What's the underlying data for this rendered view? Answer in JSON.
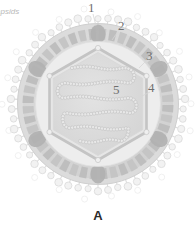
{
  "figure": {
    "panel_letter": "A",
    "side_caption": "apsids",
    "labels": [
      {
        "id": "1",
        "text": "1",
        "x": 88,
        "y": 2,
        "target": "glycoprotein-spikes"
      },
      {
        "id": "2",
        "text": "2",
        "x": 118,
        "y": 21,
        "target": "lipid-envelope"
      },
      {
        "id": "3",
        "text": "3",
        "x": 146,
        "y": 50,
        "target": "tegument-matrix"
      },
      {
        "id": "4",
        "text": "4",
        "x": 148,
        "y": 82,
        "target": "capsid-shell"
      },
      {
        "id": "5",
        "text": "5",
        "x": 113,
        "y": 84,
        "target": "nucleic-acid-genome"
      }
    ],
    "colors": {
      "background": "#ffffff",
      "spike_stroke": "#dcdcdc",
      "spike_fill": "#f2f2f2",
      "envelope_outer": "#dadada",
      "envelope_band": "#c9c9c9",
      "envelope_segment": "#bdbdbd",
      "vertex_cap": "#b0b0b0",
      "gap_light": "#eeeeee",
      "capsid_stroke": "#c6c6c6",
      "capsid_fill": "#e4e4e4",
      "core_fill": "#dcdcdc",
      "genome_stroke": "#c8c8c8",
      "label_text": "#6f6f6f",
      "panel_letter": "#2a2a2a"
    },
    "geometry": {
      "center_x": 98,
      "center_y": 104,
      "envelope_radius": 80,
      "capsid_radius": 56,
      "spike_count": 54,
      "segment_count": 44,
      "hex_vertices": 6
    }
  }
}
